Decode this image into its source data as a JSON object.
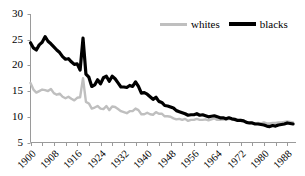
{
  "chart_data": {
    "type": "line",
    "title": "",
    "subtitle": "",
    "xlabel": "",
    "ylabel": "",
    "xlim": [
      1900,
      1991
    ],
    "ylim": [
      5,
      30
    ],
    "grid": false,
    "legend_position": "top-right",
    "y_ticks": [
      5,
      10,
      15,
      20,
      25,
      30
    ],
    "y_tick_labels": [
      "5",
      "10",
      "15",
      "20",
      "25",
      "30"
    ],
    "x_tick_labels": [
      "1900",
      "1908",
      "1916",
      "1924",
      "1932",
      "1940",
      "1948",
      "1956",
      "1964",
      "1972",
      "1980",
      "1988"
    ],
    "x_tick_values": [
      1900,
      1908,
      1916,
      1924,
      1932,
      1940,
      1948,
      1956,
      1964,
      1972,
      1980,
      1988
    ],
    "x_minor_tick_interval": 4,
    "x": [
      1900,
      1901,
      1902,
      1903,
      1904,
      1905,
      1906,
      1907,
      1908,
      1909,
      1910,
      1911,
      1912,
      1913,
      1914,
      1915,
      1916,
      1917,
      1918,
      1919,
      1920,
      1921,
      1922,
      1923,
      1924,
      1925,
      1926,
      1927,
      1928,
      1929,
      1930,
      1931,
      1932,
      1933,
      1934,
      1935,
      1936,
      1937,
      1938,
      1939,
      1940,
      1941,
      1942,
      1943,
      1944,
      1945,
      1946,
      1947,
      1948,
      1949,
      1950,
      1951,
      1952,
      1953,
      1954,
      1955,
      1956,
      1957,
      1958,
      1959,
      1960,
      1961,
      1962,
      1963,
      1964,
      1965,
      1966,
      1967,
      1968,
      1969,
      1970,
      1971,
      1972,
      1973,
      1974,
      1975,
      1976,
      1977,
      1978,
      1979,
      1980,
      1981,
      1982,
      1983,
      1984,
      1985,
      1986,
      1987,
      1988,
      1989,
      1990
    ],
    "series": [
      {
        "name": "whites",
        "color": "#bfbfbf",
        "line_width": 2.4,
        "values": [
          16.6,
          15.3,
          14.7,
          15.0,
          15.3,
          15.2,
          15.0,
          15.4,
          14.6,
          14.3,
          14.5,
          13.9,
          13.6,
          13.9,
          13.5,
          13.2,
          13.7,
          13.8,
          17.5,
          12.9,
          12.6,
          11.6,
          11.8,
          12.1,
          11.6,
          11.5,
          12.1,
          11.3,
          12.0,
          11.9,
          11.5,
          11.1,
          10.9,
          10.7,
          11.1,
          11.1,
          11.6,
          11.3,
          10.5,
          10.5,
          10.8,
          10.5,
          10.4,
          10.9,
          10.6,
          10.6,
          10.1,
          10.1,
          10.0,
          9.7,
          9.5,
          9.6,
          9.4,
          9.6,
          9.2,
          9.4,
          9.4,
          9.6,
          9.4,
          9.4,
          9.5,
          9.3,
          9.5,
          9.7,
          9.4,
          9.4,
          9.5,
          9.4,
          9.6,
          9.5,
          9.5,
          9.3,
          9.4,
          9.3,
          9.0,
          8.8,
          8.8,
          8.7,
          8.8,
          8.7,
          8.9,
          8.7,
          8.7,
          8.8,
          8.8,
          8.9,
          8.9,
          9.0,
          9.1,
          9.0,
          8.9
        ]
      },
      {
        "name": "blacks",
        "color": "#000000",
        "line_width": 3.2,
        "values": [
          24.4,
          23.4,
          23.0,
          24.0,
          24.5,
          25.6,
          24.7,
          24.2,
          23.6,
          23.0,
          22.5,
          21.7,
          21.2,
          21.3,
          20.7,
          20.2,
          20.3,
          19.1,
          25.3,
          18.3,
          17.7,
          15.9,
          16.2,
          17.2,
          16.4,
          17.6,
          17.9,
          16.9,
          17.9,
          17.4,
          16.6,
          15.8,
          15.8,
          15.7,
          16.1,
          15.9,
          16.8,
          15.9,
          14.6,
          14.7,
          14.4,
          13.9,
          13.4,
          13.8,
          13.0,
          12.8,
          12.2,
          12.1,
          11.9,
          11.7,
          11.2,
          11.0,
          10.8,
          10.6,
          10.3,
          10.4,
          10.4,
          10.6,
          10.3,
          10.4,
          10.2,
          10.0,
          10.1,
          10.2,
          10.0,
          9.8,
          9.8,
          9.6,
          9.8,
          9.6,
          9.5,
          9.3,
          9.3,
          9.2,
          8.9,
          8.8,
          8.8,
          8.6,
          8.6,
          8.5,
          8.4,
          8.2,
          8.1,
          8.3,
          8.2,
          8.4,
          8.5,
          8.6,
          8.8,
          8.7,
          8.6
        ]
      }
    ]
  },
  "legend": {
    "entries": [
      {
        "label": "whites"
      },
      {
        "label": "blacks"
      }
    ]
  },
  "axes": {
    "y_labels": [
      "30",
      "25",
      "20",
      "15",
      "10",
      "5"
    ],
    "x_labels": [
      "1900",
      "1908",
      "1916",
      "1924",
      "1932",
      "1940",
      "1948",
      "1956",
      "1964",
      "1972",
      "1980",
      "1988"
    ]
  },
  "colors": {
    "whites_line": "#bfbfbf",
    "blacks_line": "#000000",
    "axis": "#808080",
    "background": "#ffffff"
  }
}
